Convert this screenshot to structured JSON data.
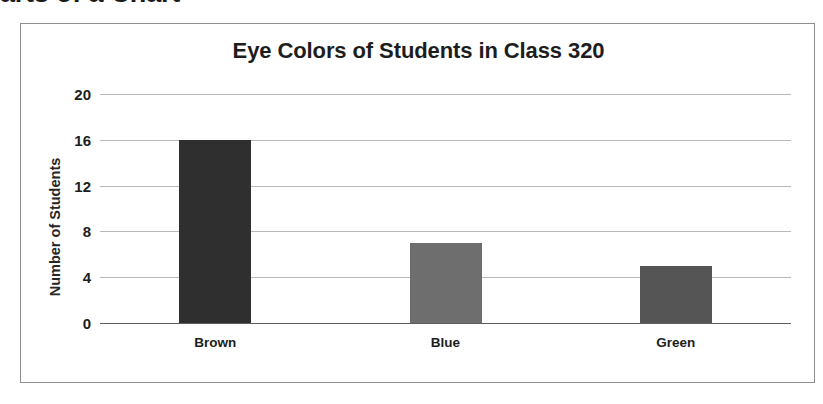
{
  "page": {
    "heading": "arts of a Chart"
  },
  "chart_data": {
    "type": "bar",
    "title": "Eye Colors of Students in Class 320",
    "xlabel": "",
    "ylabel": "Number of Students",
    "categories": [
      "Brown",
      "Blue",
      "Green"
    ],
    "values": [
      16,
      7,
      5
    ],
    "bar_colors": [
      "#2f2f2f",
      "#6e6e6e",
      "#555555"
    ],
    "ylim": [
      0,
      20
    ],
    "yticks": [
      0,
      4,
      8,
      12,
      16,
      20
    ],
    "ytick_labels": [
      "0",
      "4",
      "8",
      "12",
      "16",
      "20"
    ],
    "grid": true,
    "legend": false,
    "frame_color": "#8d8d8d",
    "gridline_color": "#b9b9b9",
    "axis_color": "#5e5e5e",
    "background": "#ffffff"
  }
}
